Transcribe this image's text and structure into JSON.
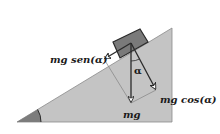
{
  "figure": {
    "colors": {
      "background": "#ffffff",
      "incline_fill": "#c4c4c4",
      "incline_edge": "#7a7a7a",
      "angle_wedge": "#7c7c7c",
      "block_fill": "#7a7a7a",
      "block_edge": "#2a2a2a",
      "arrow": "#2a2a2a",
      "construction_line": "#8a8a8a"
    },
    "labels": {
      "parallel_component": "mg sen(α)",
      "perpendicular_component": "mg cos(α)",
      "weight": "mg",
      "angle_at_block": "α"
    },
    "elements": {
      "incline": {
        "type": "right-triangle",
        "vertices": [
          [
            17,
            122
          ],
          [
            172,
            122
          ],
          [
            172,
            28
          ]
        ]
      },
      "base_angle_marker": {
        "type": "arc-wedge",
        "at": [
          17,
          122
        ],
        "symbol": "α (unlabeled)"
      },
      "block": {
        "type": "rotated-rectangle",
        "corners": [
          [
            113,
            42
          ],
          [
            140,
            29
          ],
          [
            148,
            42
          ],
          [
            120,
            58
          ]
        ]
      },
      "vectors": [
        {
          "name": "weight",
          "from": [
            131,
            43
          ],
          "to": [
            131,
            103
          ],
          "label": "mg"
        },
        {
          "name": "normal_component",
          "from": [
            131,
            43
          ],
          "to": [
            156,
            90
          ],
          "label": "mg cos(α)"
        },
        {
          "name": "tangential_component",
          "from": [
            131,
            43
          ],
          "to": [
            104,
            59
          ],
          "label": "mg sen(α)"
        }
      ],
      "construction_lines": [
        {
          "from": [
            104,
            59
          ],
          "to": [
            131,
            103
          ]
        },
        {
          "from": [
            156,
            90
          ],
          "to": [
            131,
            103
          ]
        }
      ]
    }
  }
}
